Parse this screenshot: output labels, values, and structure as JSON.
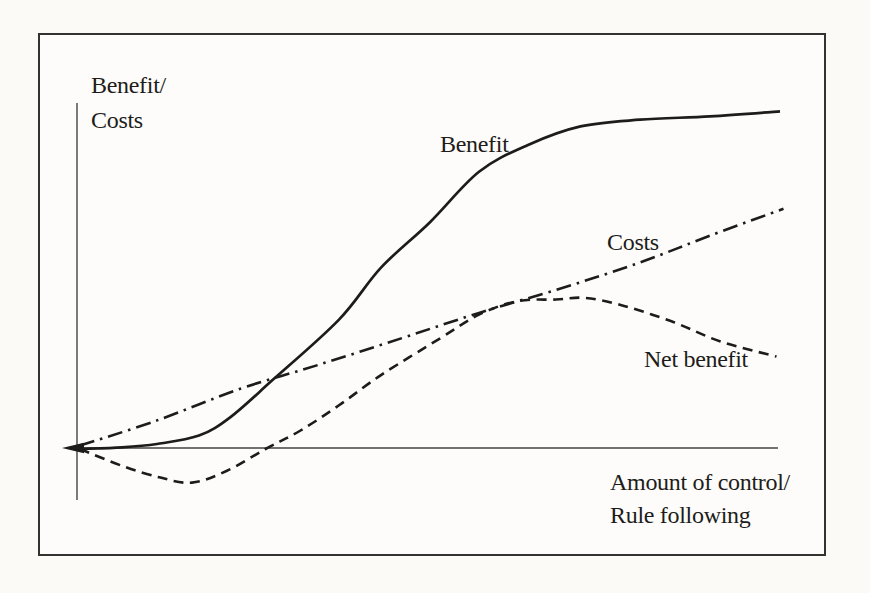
{
  "figure": {
    "background": "#fbfaf7",
    "frame_border_color": "#343230",
    "ink_color": "#1d1c1a",
    "axis_color": "#45433f"
  },
  "labels": {
    "y_axis_line1": "Benefit/",
    "y_axis_line2": "Costs",
    "x_axis_line1": "Amount of control/",
    "x_axis_line2": "Rule following"
  },
  "chart_data": {
    "type": "line",
    "title": "",
    "xlabel": "Amount of control/ Rule following",
    "ylabel": "Benefit/ Costs",
    "x_range": [
      0,
      100
    ],
    "y_range": [
      -12,
      105
    ],
    "grid": false,
    "axes_quantitative": false,
    "legend_position": "inline-labels",
    "axis_arrow": "left-end-of-x-axis",
    "series": [
      {
        "name": "Benefit",
        "line_style": "solid",
        "description": "S-shaped curve rising from origin, steep in middle, plateauing at top right",
        "points": [
          [
            0,
            0
          ],
          [
            6,
            0.5
          ],
          [
            11,
            1.5
          ],
          [
            17,
            4
          ],
          [
            21.5,
            9.5
          ],
          [
            27.5,
            20.5
          ],
          [
            37,
            38.5
          ],
          [
            43,
            54
          ],
          [
            50,
            67.5
          ],
          [
            57,
            82.5
          ],
          [
            64,
            90.5
          ],
          [
            71.5,
            96
          ],
          [
            80,
            98
          ],
          [
            90,
            99
          ],
          [
            100,
            100.5
          ]
        ]
      },
      {
        "name": "Costs",
        "line_style": "dash-dot",
        "description": "Nearly straight line rising steadily from origin",
        "points": [
          [
            0,
            1
          ],
          [
            11,
            8.5
          ],
          [
            23,
            18
          ],
          [
            34,
            25
          ],
          [
            46,
            33
          ],
          [
            57,
            40.5
          ],
          [
            69,
            48
          ],
          [
            80,
            55.5
          ],
          [
            90,
            63.5
          ],
          [
            100.5,
            71.5
          ]
        ]
      },
      {
        "name": "Net benefit",
        "line_style": "dashed",
        "description": "Dips below zero near origin, rises to a maximum, then declines",
        "points": [
          [
            0,
            0
          ],
          [
            6,
            -5
          ],
          [
            11.5,
            -8.5
          ],
          [
            16,
            -10
          ],
          [
            21,
            -6.5
          ],
          [
            26.5,
            0
          ],
          [
            31.5,
            5.5
          ],
          [
            37,
            13
          ],
          [
            43,
            22
          ],
          [
            51.5,
            33
          ],
          [
            57,
            40
          ],
          [
            62.5,
            44
          ],
          [
            68,
            44.5
          ],
          [
            72,
            45
          ],
          [
            77,
            43
          ],
          [
            84.5,
            38
          ],
          [
            91.5,
            32
          ],
          [
            99.5,
            27.5
          ]
        ]
      }
    ]
  }
}
